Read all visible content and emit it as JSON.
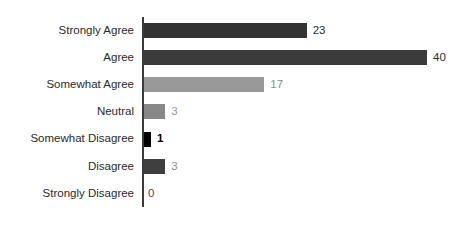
{
  "chart_data": {
    "type": "bar",
    "orientation": "horizontal",
    "title": "",
    "xlabel": "",
    "ylabel": "",
    "categories": [
      "Strongly Agree",
      "Agree",
      "Somewhat Agree",
      "Neutral",
      "Somewhat Disagree",
      "Disagree",
      "Strongly Disagree"
    ],
    "values": [
      23,
      40,
      17,
      3,
      1,
      3,
      0
    ],
    "value_labels": [
      "23",
      "40",
      "17",
      "3",
      "1",
      "3",
      "0"
    ],
    "bar_colors": [
      "#333333",
      "#3b3b3b",
      "#999999",
      "#888888",
      "#000000",
      "#3f3f3f",
      "#ffffff"
    ],
    "label_colors": [
      "#2b2b2b",
      "#2b2b2b",
      "#8d8d8d",
      "#9a9a9a",
      "#000000",
      "#8d8d8d",
      "#4a4a4a"
    ],
    "label_weights": [
      "normal",
      "normal",
      "normal",
      "normal",
      "bold",
      "normal",
      "normal"
    ],
    "xlim": [
      0,
      40
    ],
    "grid": false,
    "legend": false,
    "axis_color": "#3a3a3a"
  },
  "axis": {
    "category_axis_visible": true
  }
}
